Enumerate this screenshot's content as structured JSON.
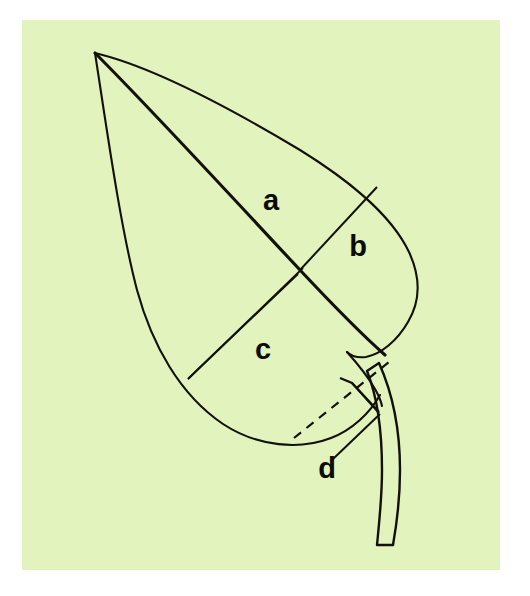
{
  "figure": {
    "background_color": "#ffffff",
    "panel_color": "#e2f3bd",
    "ink_color": "#111108",
    "panel": {
      "x": 22,
      "y": 20,
      "width": 478,
      "height": 550
    }
  },
  "labels": {
    "a": {
      "text": "a",
      "x": 271,
      "y": 202,
      "meaning": "distance from leaf apex to widest point along midrib"
    },
    "b": {
      "text": "b",
      "x": 358,
      "y": 248,
      "meaning": "half-width of leaf blade at widest point"
    },
    "c": {
      "text": "c",
      "x": 263,
      "y": 351,
      "meaning": "width measurement across lower blade"
    },
    "d": {
      "text": "d",
      "x": 327,
      "y": 470,
      "meaning": "perpendicular offset at leaf base"
    }
  },
  "chart_data": {
    "type": "diagram",
    "measurements": [
      {
        "id": "a",
        "label": "a",
        "kind": "midrib-segment",
        "from": [
          95,
          53
        ],
        "to": [
          300,
          270
        ]
      },
      {
        "id": "b",
        "label": "b",
        "kind": "transverse-line",
        "from": [
          300,
          270
        ],
        "to": [
          376,
          188
        ]
      },
      {
        "id": "c",
        "label": "c",
        "kind": "double-line",
        "from": [
          300,
          270
        ],
        "to": [
          190,
          375
        ]
      },
      {
        "id": "d",
        "label": "d",
        "kind": "perpendicular-offset",
        "from": [
          352,
          383
        ],
        "to": [
          378,
          412
        ]
      }
    ],
    "annotations": [
      {
        "type": "dashed-line",
        "from": [
          295,
          437
        ],
        "to": [
          388,
          363
        ]
      },
      {
        "type": "right-angle-mark",
        "vertex": [
          352,
          383
        ]
      },
      {
        "type": "leader-line",
        "from": [
          334,
          457
        ],
        "to": [
          378,
          414
        ]
      }
    ],
    "axis_labels": [
      "a",
      "b",
      "c",
      "d"
    ],
    "grid": false,
    "legend": false
  }
}
